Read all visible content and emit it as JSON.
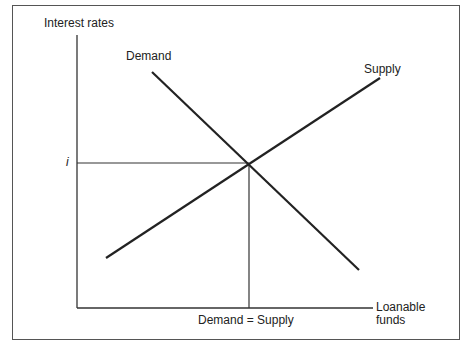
{
  "diagram": {
    "y_axis_label": "Interest rates",
    "x_axis_label_line1": "Loanable",
    "x_axis_label_line2": "funds",
    "equilibrium_rate_label": "i",
    "equilibrium_quantity_label": "Demand = Supply",
    "curves": [
      {
        "name": "Demand",
        "slope": "downward"
      },
      {
        "name": "Supply",
        "slope": "upward"
      }
    ]
  }
}
